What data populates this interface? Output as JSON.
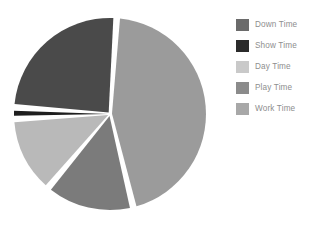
{
  "chart_data": {
    "type": "pie",
    "title": "",
    "categories": [
      "Down Time",
      "Show Time",
      "Day Time",
      "Play Time",
      "Work Time"
    ],
    "values": [
      25,
      2,
      13,
      15,
      45
    ],
    "colors": [
      "#4a4a4a",
      "#1e1e1e",
      "#b9b9b9",
      "#7b7b7b",
      "#9b9b9b"
    ],
    "legend_position": "right",
    "grid": false,
    "slice_gap": true,
    "start_angle": -86,
    "direction": "counterclockwise"
  },
  "legend": {
    "items": [
      {
        "label": "Down Time",
        "color": "#6b6b6b"
      },
      {
        "label": "Show Time",
        "color": "#2b2b2b"
      },
      {
        "label": "Day Time",
        "color": "#c9c9c9"
      },
      {
        "label": "Play Time",
        "color": "#8b8b8b"
      },
      {
        "label": "Work Time",
        "color": "#a8a8a8"
      }
    ]
  },
  "pie": {
    "center_x": 110,
    "center_y": 114,
    "radius": 96,
    "slices": [
      {
        "name": "Work Time",
        "color": "#9b9b9b",
        "start": -86,
        "end": 76
      },
      {
        "name": "Play Time",
        "color": "#7b7b7b",
        "start": 76,
        "end": 130
      },
      {
        "name": "Day Time",
        "color": "#b9b9b9",
        "start": 130,
        "end": 177
      },
      {
        "name": "Show Time",
        "color": "#1e1e1e",
        "start": 177,
        "end": 184
      },
      {
        "name": "Down Time",
        "color": "#4a4a4a",
        "start": 184,
        "end": 274
      }
    ]
  }
}
